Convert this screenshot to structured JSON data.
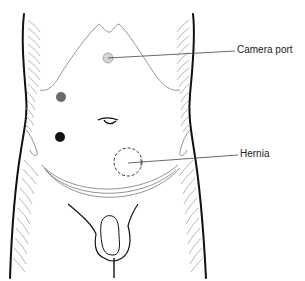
{
  "diagram": {
    "labels": {
      "camera_port": "Camera port",
      "hernia": "Hernia"
    },
    "markers": [
      {
        "name": "camera-port",
        "shape": "circle",
        "fill": "#d4d4d4",
        "stroke": "#9a9a9a",
        "cx": 108,
        "cy": 58,
        "r": 5
      },
      {
        "name": "working-port-upper",
        "shape": "circle",
        "fill": "#6a6a6a",
        "cx": 61,
        "cy": 97,
        "r": 5
      },
      {
        "name": "working-port-lower",
        "shape": "circle",
        "fill": "#111111",
        "cx": 60,
        "cy": 137,
        "r": 5
      },
      {
        "name": "hernia-site",
        "shape": "dashed-circle",
        "stroke": "#333333",
        "cx": 128,
        "cy": 162,
        "r": 14
      }
    ],
    "colors": {
      "outline": "#111111",
      "hatching": "#9a9a9a",
      "rib_line": "#8a8a8a",
      "leader": "#444444"
    }
  }
}
